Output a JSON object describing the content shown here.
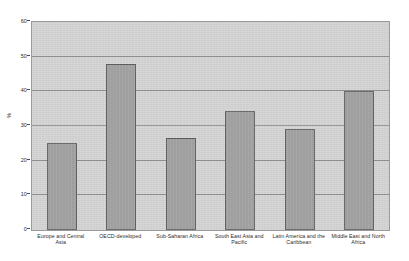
{
  "chart_data": {
    "type": "bar",
    "title": "",
    "subtitle": "",
    "xlabel": "",
    "ylabel": "%",
    "ylim": [
      0,
      60
    ],
    "ytick_values": [
      0,
      10,
      20,
      30,
      40,
      50,
      60
    ],
    "ytick_labels": [
      "0",
      "10",
      "20",
      "30",
      "40",
      "50",
      "60"
    ],
    "grid": true,
    "legend": false,
    "legend_position": "none",
    "categories": [
      "Europe and Central Asia",
      "OECD-developed",
      "Sub-Saharan Africa",
      "South East Asia and Pacific",
      "Latin America and the Caribbean",
      "Middle East and North Africa"
    ],
    "values": [
      25.2,
      48.0,
      26.4,
      34.3,
      29.0,
      40.2
    ],
    "series": [
      {
        "name": "%",
        "values": [
          25.2,
          48.0,
          26.4,
          34.3,
          29.0,
          40.2
        ]
      }
    ]
  },
  "style": {
    "plot_background": "#d2d2d2",
    "bar_fill": "#9b9b9b",
    "bar_border": "#5c5c5c",
    "gridline_color": "#8e8e8e",
    "axis_color": "#9a9a9a",
    "text_color": "#2b2b2b",
    "page_background": "#ffffff"
  },
  "artifacts": {
    "top_strip_text": ""
  }
}
